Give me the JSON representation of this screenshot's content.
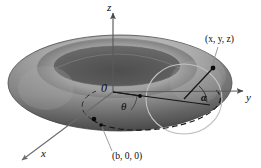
{
  "figure": {
    "type": "diagram",
    "background_color": "#ffffff",
    "width": 261,
    "height": 168
  },
  "axes": {
    "z": {
      "label": "z",
      "direction": "up",
      "arrow": true
    },
    "y": {
      "label": "y",
      "direction": "right",
      "arrow": true
    },
    "x": {
      "label": "x",
      "direction": "lower-left",
      "arrow": true
    },
    "origin": {
      "label": "0"
    }
  },
  "angles": {
    "theta": {
      "label": "θ",
      "description": "azimuthal angle in xy-plane measured from x-axis"
    },
    "alpha": {
      "label": "α",
      "description": "angle around the tube cross-section"
    }
  },
  "points": [
    {
      "id": "point-xyz",
      "label": "(x, y, z)",
      "description": "general point on the torus surface"
    },
    {
      "id": "point-b",
      "label": "(b, 0, 0)",
      "description": "point on the x-axis at the center circle radius"
    },
    {
      "id": "point-center-tube",
      "label": "",
      "description": "center of tube cross-section on the center circle"
    },
    {
      "id": "point-theta-vertex",
      "label": "",
      "description": "vertex marker along the theta ray"
    }
  ],
  "surface": {
    "name": "torus",
    "shading": {
      "highlight_color": "#c0c0c0",
      "mid_color": "#8e8e8e",
      "shadow_color": "#5a5a5a",
      "hole_color": "#5f5f5f",
      "outline_color": "#4a4a4a"
    }
  },
  "guides": {
    "center_circle": {
      "style": "dashed",
      "color": "#141414",
      "description": "dashed ellipse: center circle of radius b"
    },
    "tube_circle": {
      "style": "solid-light",
      "color": "#b9b9b9",
      "description": "cross-sectional circle of the tube"
    },
    "radius_line": {
      "style": "solid",
      "color": "#141414",
      "description": "line from origin through theta to the surface point"
    },
    "z_axis_line": {
      "style": "solid",
      "color": "#555555"
    }
  },
  "colors": {
    "ink": "#0a0a0a",
    "axis": "#5a5a5a",
    "dash": "#141414",
    "page": "#ffffff"
  }
}
